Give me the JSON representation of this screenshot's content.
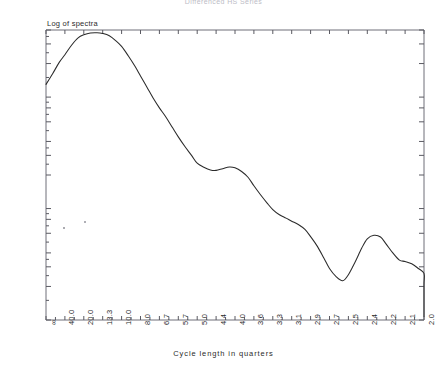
{
  "chart_data": {
    "type": "line",
    "title": "Differenced HS Series",
    "xlabel": "Cycle length in quarters",
    "ylabel": "Log of spectra",
    "yscale": "log",
    "ylim": [
      0.01,
      4.0
    ],
    "grid": false,
    "legend": null,
    "ytick_labels": [
      "4.00",
      "3.00",
      "2.00",
      "1.00",
      ".80",
      ".60",
      ".40",
      ".30",
      ".20",
      ".10",
      ".08",
      ".06",
      ".04",
      ".03",
      ".02",
      ".01"
    ],
    "ytick_values": [
      4.0,
      3.0,
      2.0,
      1.0,
      0.8,
      0.6,
      0.4,
      0.3,
      0.2,
      0.1,
      0.08,
      0.06,
      0.04,
      0.03,
      0.02,
      0.01
    ],
    "xtick_labels": [
      "∞",
      "40.0",
      "20.0",
      "13.3",
      "10.0",
      "8.0",
      "6.7",
      "5.7",
      "5.0",
      "4.4",
      "4.0",
      "3.6",
      "3.3",
      "3.1",
      "2.9",
      "2.7",
      "2.5",
      "2.4",
      "2.2",
      "2.1",
      "2.0"
    ],
    "x_index": [
      0,
      1,
      2,
      3,
      4,
      5,
      6,
      7,
      8,
      9,
      10,
      11,
      12,
      13,
      14,
      15,
      16,
      17,
      18,
      19,
      20
    ],
    "series": [
      {
        "name": "Log of spectra",
        "x": [
          0.0,
          0.35,
          0.7,
          1.0,
          1.35,
          1.7,
          2.0,
          2.35,
          2.7,
          3.0,
          3.35,
          3.7,
          4.0,
          4.35,
          4.7,
          5.0,
          5.35,
          5.7,
          6.0,
          6.35,
          6.7,
          7.0,
          7.35,
          7.7,
          8.0,
          8.35,
          8.7,
          9.0,
          9.35,
          9.7,
          10.0,
          10.35,
          10.7,
          11.0,
          11.35,
          11.7,
          12.0,
          12.35,
          12.7,
          13.0,
          13.35,
          13.7,
          14.0,
          14.35,
          14.7,
          15.0,
          15.35,
          15.7,
          16.0,
          16.35,
          16.7,
          17.0,
          17.35,
          17.7,
          18.0,
          18.35,
          18.7,
          19.0,
          19.35,
          19.7,
          20.0
        ],
        "values": [
          1.3,
          1.62,
          2.05,
          2.4,
          2.92,
          3.4,
          3.62,
          3.76,
          3.78,
          3.72,
          3.55,
          3.2,
          2.85,
          2.35,
          1.9,
          1.55,
          1.22,
          0.96,
          0.8,
          0.66,
          0.53,
          0.44,
          0.36,
          0.3,
          0.255,
          0.235,
          0.222,
          0.22,
          0.228,
          0.236,
          0.232,
          0.215,
          0.19,
          0.16,
          0.133,
          0.112,
          0.098,
          0.088,
          0.082,
          0.077,
          0.072,
          0.065,
          0.056,
          0.046,
          0.036,
          0.029,
          0.0245,
          0.0225,
          0.0255,
          0.033,
          0.044,
          0.0535,
          0.0575,
          0.0555,
          0.048,
          0.04,
          0.0345,
          0.0335,
          0.032,
          0.029,
          0.0262
        ],
        "note": "Smoothed spectral density curve; global peak ~3.78 near 20-quarter cycles, trough ~0.022 near 4.0 quarters, secondary peak ~0.058 near 3.1 quarters, ending ~0.011 at 2.0 quarters"
      }
    ],
    "tail_x": [
      20.0,
      20.35,
      20.7,
      21.0
    ],
    "tail_values": [
      0.0262,
      0.021,
      0.0145,
      0.0108
    ]
  },
  "axes": {
    "plot_left_px": 46,
    "plot_right_px": 424,
    "plot_top_px": 30,
    "plot_bottom_px": 320
  },
  "artifacts": {
    "speck_label": "scan-speckle"
  }
}
